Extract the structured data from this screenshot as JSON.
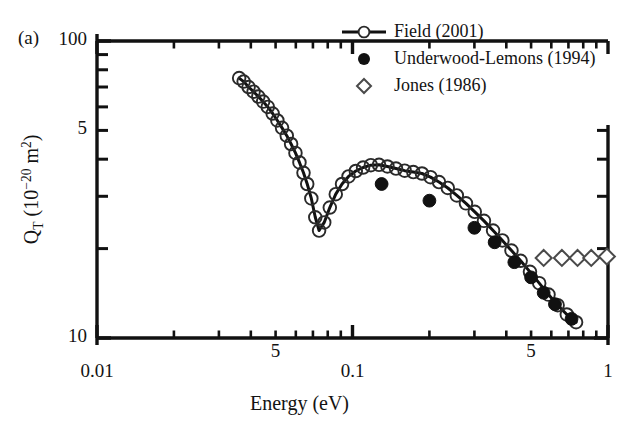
{
  "figure": {
    "panel_label": "(a)",
    "xlabel": "Energy (eV)",
    "ylabel_main": "Q",
    "ylabel_sub": "T",
    "ylabel_units_open": " (10",
    "ylabel_units_exp": "−20",
    "ylabel_units_close": " m",
    "ylabel_units_sq": "2",
    "ylabel_units_end": ")",
    "ylabel_plain": "Q_T (10^-20 m^2)"
  },
  "axes": {
    "x": {
      "scale": "log",
      "min": 0.01,
      "max": 1.0,
      "major_ticks": [
        {
          "value": 0.01,
          "label": "0.01"
        },
        {
          "value": 0.1,
          "label": "0.1"
        },
        {
          "value": 1.0,
          "label": "1"
        }
      ],
      "minor_labeled_ticks": [
        {
          "value": 0.05,
          "label": "5"
        },
        {
          "value": 0.5,
          "label": "5"
        }
      ]
    },
    "y": {
      "scale": "log",
      "min": 10,
      "max": 100,
      "major_ticks": [
        {
          "value": 10,
          "label": "10"
        },
        {
          "value": 100,
          "label": "100"
        }
      ],
      "minor_labeled_ticks": [
        {
          "value": 50,
          "label": "5"
        }
      ]
    }
  },
  "legend": {
    "entries": [
      {
        "label": "Field (2001)",
        "marker": "line-open-circle",
        "color": "#111111"
      },
      {
        "label": "Underwood-Lemons (1994)",
        "marker": "filled-circle",
        "color": "#111111"
      },
      {
        "label": "Jones (1986)",
        "marker": "open-diamond",
        "color": "#555555"
      }
    ]
  },
  "chart_data": {
    "type": "scatter",
    "title": "",
    "xlabel": "Energy (eV)",
    "ylabel": "Q_T (10^-20 m^2)",
    "xscale": "log",
    "yscale": "log",
    "xlim": [
      0.01,
      1.0
    ],
    "ylim": [
      10,
      100
    ],
    "grid": false,
    "legend_position": "top-right",
    "series": [
      {
        "name": "Field (2001)",
        "marker": "open-circle",
        "line": true,
        "x": [
          0.036,
          0.0375,
          0.0392,
          0.041,
          0.0428,
          0.0447,
          0.0466,
          0.0487,
          0.0508,
          0.053,
          0.0553,
          0.0575,
          0.0598,
          0.062,
          0.0643,
          0.0665,
          0.069,
          0.0715,
          0.074,
          0.0775,
          0.0815,
          0.086,
          0.091,
          0.0965,
          0.103,
          0.11,
          0.118,
          0.127,
          0.137,
          0.148,
          0.16,
          0.173,
          0.187,
          0.202,
          0.218,
          0.236,
          0.256,
          0.278,
          0.301,
          0.327,
          0.355,
          0.386,
          0.419,
          0.455,
          0.495,
          0.538,
          0.585,
          0.635,
          0.69,
          0.75
        ],
        "y": [
          75.0,
          73.0,
          70.0,
          67.5,
          65.0,
          62.5,
          60.0,
          57.0,
          54.0,
          51.0,
          48.0,
          45.0,
          42.0,
          39.0,
          36.0,
          33.0,
          29.5,
          25.5,
          23.0,
          24.5,
          27.5,
          30.5,
          33.0,
          35.0,
          36.5,
          37.5,
          38.2,
          38.3,
          37.8,
          37.2,
          36.6,
          36.2,
          35.8,
          34.8,
          33.5,
          32.0,
          30.2,
          28.4,
          26.6,
          24.8,
          23.0,
          21.3,
          19.7,
          18.2,
          16.7,
          15.3,
          14.0,
          12.9,
          12.0,
          11.3
        ]
      },
      {
        "name": "Underwood-Lemons (1994)",
        "marker": "filled-circle",
        "line": false,
        "x": [
          0.13,
          0.2,
          0.3,
          0.36,
          0.43,
          0.5,
          0.56,
          0.62,
          0.72
        ],
        "y": [
          33.0,
          29.0,
          23.5,
          21.0,
          18.0,
          16.0,
          14.2,
          13.0,
          11.6
        ]
      },
      {
        "name": "Jones (1986)",
        "marker": "open-diamond",
        "line": false,
        "x": [
          0.56,
          0.66,
          0.76,
          0.86,
          0.99
        ],
        "y": [
          18.6,
          18.6,
          18.6,
          18.6,
          18.8
        ]
      }
    ]
  }
}
